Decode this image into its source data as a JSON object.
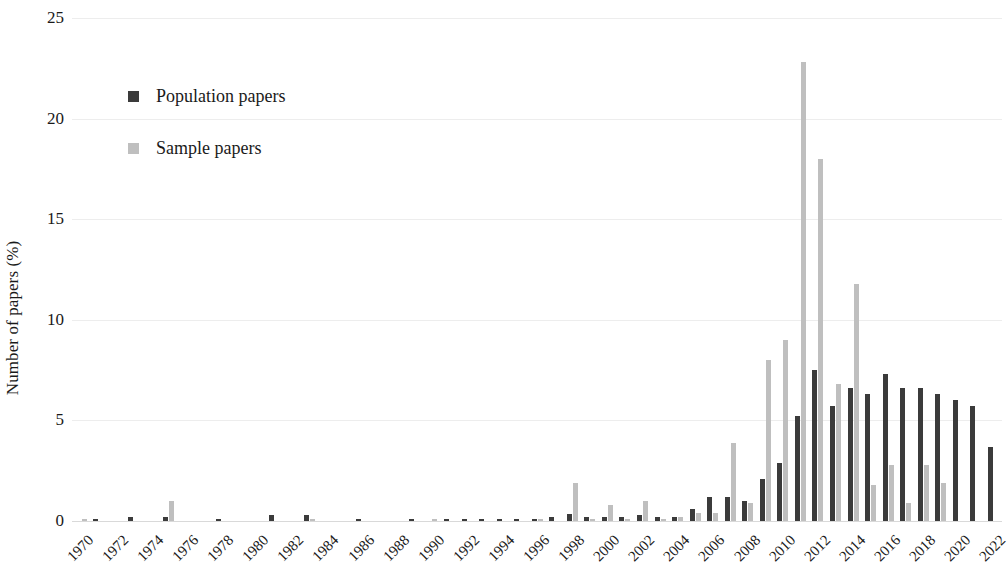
{
  "chart_data": {
    "type": "bar",
    "title": "",
    "subtitle": "",
    "xlabel": "",
    "ylabel": "Number of papers (%)",
    "ylim": [
      0,
      25
    ],
    "y_ticks": [
      0,
      5,
      10,
      15,
      20,
      25
    ],
    "grid": true,
    "legend_position": "top-left",
    "x_tick_labels": [
      "1970",
      "1972",
      "1974",
      "1976",
      "1978",
      "1980",
      "1982",
      "1984",
      "1986",
      "1988",
      "1990",
      "1992",
      "1994",
      "1996",
      "1998",
      "2000",
      "2002",
      "2004",
      "2006",
      "2008",
      "2010",
      "2012",
      "2014",
      "2016",
      "2018",
      "2020",
      "2022"
    ],
    "x_tick_step": 2,
    "categories": [
      1970,
      1971,
      1972,
      1973,
      1974,
      1975,
      1976,
      1977,
      1978,
      1979,
      1980,
      1981,
      1982,
      1983,
      1984,
      1985,
      1986,
      1987,
      1988,
      1989,
      1990,
      1991,
      1992,
      1993,
      1994,
      1995,
      1996,
      1997,
      1998,
      1999,
      2000,
      2001,
      2002,
      2003,
      2004,
      2005,
      2006,
      2007,
      2008,
      2009,
      2010,
      2011,
      2012,
      2013,
      2014,
      2015,
      2016,
      2017,
      2018,
      2019,
      2020,
      2021,
      2022
    ],
    "series": [
      {
        "name": "Population papers",
        "color": "#3b3b3b",
        "values": [
          0.0,
          0.1,
          0.0,
          0.2,
          0.0,
          0.2,
          0.0,
          0.0,
          0.1,
          0.0,
          0.0,
          0.3,
          0.0,
          0.3,
          0.0,
          0.0,
          0.1,
          0.0,
          0.0,
          0.1,
          0.0,
          0.1,
          0.1,
          0.1,
          0.1,
          0.1,
          0.1,
          0.2,
          0.35,
          0.2,
          0.2,
          0.2,
          0.3,
          0.2,
          0.2,
          0.6,
          1.2,
          1.2,
          1.0,
          2.1,
          2.9,
          5.2,
          7.5,
          5.7,
          6.6,
          6.3,
          7.3,
          6.6,
          6.6,
          6.3,
          6.0,
          5.7,
          3.7
        ]
      },
      {
        "name": "Sample papers",
        "color": "#bfbfbf",
        "values": [
          0.1,
          0.0,
          0.0,
          0.0,
          0.0,
          1.0,
          0.0,
          0.0,
          0.0,
          0.0,
          0.0,
          0.0,
          0.0,
          0.1,
          0.0,
          0.0,
          0.0,
          0.0,
          0.0,
          0.0,
          0.1,
          0.0,
          0.0,
          0.0,
          0.0,
          0.0,
          0.1,
          0.0,
          1.9,
          0.1,
          0.8,
          0.1,
          1.0,
          0.1,
          0.2,
          0.4,
          0.4,
          3.9,
          0.9,
          8.0,
          9.0,
          22.8,
          18.0,
          6.8,
          11.8,
          1.8,
          2.8,
          0.9,
          2.8,
          1.9,
          0.0,
          0.0,
          0.0
        ]
      }
    ]
  },
  "legend": {
    "items": [
      {
        "label": "Population papers",
        "color": "#3b3b3b",
        "marker": "square-marker"
      },
      {
        "label": "Sample papers",
        "color": "#bfbfbf",
        "marker": "square-marker"
      }
    ]
  },
  "axes": {
    "y_title": "Number of papers (%)"
  }
}
